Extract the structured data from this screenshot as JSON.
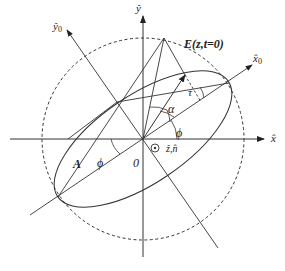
{
  "diagram": {
    "type": "polarization-ellipse",
    "labels": {
      "x_axis": "x̂",
      "y_axis": "ŷ",
      "x0_axis": "x̂",
      "x0_sub": "0",
      "y0_axis": "ŷ",
      "y0_sub": "0",
      "field": "E(z,t=0)",
      "amplitude": "A",
      "phi_left": "ϕ",
      "phi_right": "ϕ",
      "alpha": "α",
      "tau": "τ",
      "origin": "0",
      "normal": "ẑ,n̂",
      "normal_symbol": "⊙"
    },
    "colors": {
      "line": "#333333",
      "dashed": "#333333",
      "background": "#ffffff"
    }
  }
}
